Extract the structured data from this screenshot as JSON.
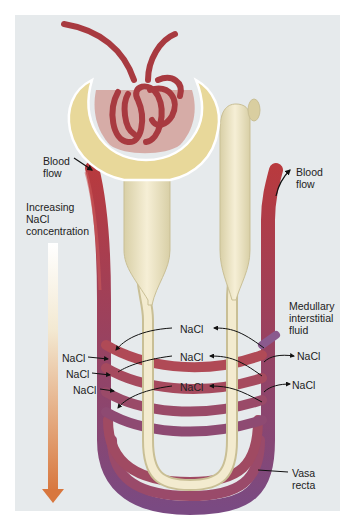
{
  "figure": {
    "colors": {
      "background": "#e6eaec",
      "frame": "#ffffff",
      "vessel_arterial": "#b83a3e",
      "vessel_venous": "#7a4a82",
      "tubule": "#efe6c2",
      "capsule": "#e8d89a",
      "gradient_top": "#ffffff",
      "gradient_bottom": "#d8773e"
    }
  },
  "labels": {
    "blood_flow_left": "Blood\nflow",
    "blood_flow_right": "Blood\nflow",
    "increasing_nacl": "Increasing\nNaCl\nconcentration",
    "medullary": "Medullary\ninterstitial\nfluid",
    "vasa_recta": "Vasa\nrecta"
  },
  "nacl_labels": {
    "left": [
      "NaCl",
      "NaCl",
      "NaCl"
    ],
    "center": [
      "NaCl",
      "NaCl",
      "NaCl"
    ],
    "right": [
      "NaCl",
      "NaCl"
    ]
  }
}
